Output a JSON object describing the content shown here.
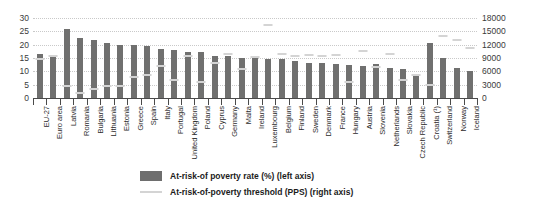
{
  "chart_data": {
    "type": "bar",
    "title": "",
    "subtitle": "",
    "xlabel": "",
    "ylabel": "",
    "grid": true,
    "legend_position": "bottom",
    "categories": [
      "EU-27",
      "Euro area",
      "Latvia",
      "Romania",
      "Bulgaria",
      "Lithuania",
      "Estonia",
      "Greece",
      "Spain",
      "Italy",
      "Portugal",
      "United Kingdom",
      "Poland",
      "Cyprus",
      "Germany",
      "Malta",
      "Ireland",
      "Luxembourg",
      "Belgium",
      "Finland",
      "Sweden",
      "Denmark",
      "France",
      "Hungary",
      "Austria",
      "Slovenia",
      "Netherlands",
      "Slovakia",
      "Czech Republic",
      "Croatia (¹)",
      "Switzerland",
      "Norway",
      "Iceland"
    ],
    "left_axis": {
      "label": "At-risk-of poverty rate  (%) (left axis)",
      "ticks": [
        0,
        5,
        10,
        15,
        20,
        25,
        30
      ],
      "ylim": [
        0,
        30
      ]
    },
    "right_axis": {
      "label": "At-risk-of-poverty threshold (PPS) (right axis)",
      "ticks": [
        0,
        3000,
        6000,
        9000,
        12000,
        15000,
        18000
      ],
      "ylim": [
        0,
        18000
      ]
    },
    "series": [
      {
        "name": "At-risk-of poverty rate  (%) (left axis)",
        "axis": "left",
        "type": "bar",
        "color": "#70706f",
        "values": [
          16.4,
          16.1,
          25.7,
          22.4,
          21.8,
          20.6,
          19.7,
          19.7,
          19.5,
          18.4,
          17.9,
          17.3,
          17.1,
          15.8,
          15.6,
          15.1,
          15.0,
          14.5,
          14.6,
          13.8,
          13.3,
          13.3,
          12.9,
          12.3,
          12.1,
          12.7,
          11.1,
          11.0,
          9.0,
          20.5,
          15.0,
          11.2,
          10.2
        ]
      },
      {
        "name": "At-risk-of-poverty threshold (PPS) (right axis)",
        "axis": "right",
        "type": "marker-line",
        "color": "#d4d4d4",
        "values": [
          8700,
          9400,
          2600,
          1200,
          2000,
          2600,
          2800,
          4700,
          5200,
          7300,
          4100,
          9400,
          3500,
          7800,
          9800,
          6600,
          9200,
          16500,
          9900,
          9500,
          9600,
          9500,
          9700,
          3700,
          10600,
          7000,
          10000,
          4100,
          5200,
          3000,
          13900,
          13000,
          11200
        ]
      }
    ]
  }
}
